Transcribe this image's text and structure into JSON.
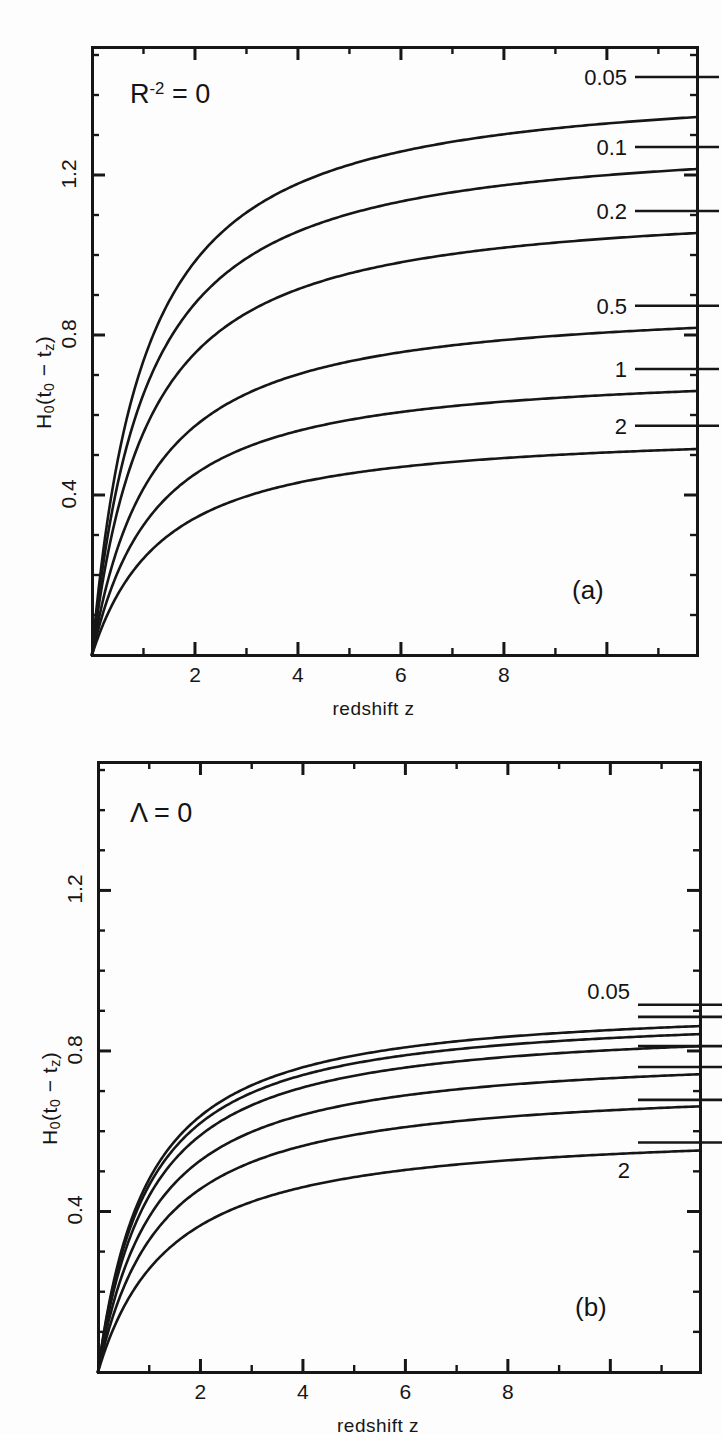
{
  "figure": {
    "background": "#fdfdfd",
    "ink_color": "#161616"
  },
  "panels": [
    {
      "id": "panel-a",
      "tag": "(a)",
      "note": "R",
      "note_sup": "-2",
      "note_tail": "= 0",
      "note_full": "R^-2 = 0",
      "frame": {
        "x": 92,
        "y": 47,
        "width": 605,
        "height": 608
      },
      "xaxis": {
        "label": "redshift  z",
        "min": 0,
        "max": 11.75,
        "ticks": [
          2,
          4,
          6,
          8
        ],
        "tick_labels": [
          "2",
          "4",
          "6",
          "8"
        ],
        "minor_step": 1
      },
      "yaxis": {
        "label": "H",
        "label_sub1": "0",
        "label_mid": "(t",
        "label_sub2": "0",
        "label_dash": " − t",
        "label_sub3": "z",
        "label_close": ")",
        "label_full": "H0(t0 - tz)",
        "min": 0,
        "max": 1.52,
        "ticks": [
          0.4,
          0.8,
          1.2
        ],
        "tick_labels": [
          "0.4",
          "0.8",
          "1.2"
        ],
        "minor_step": 0.1
      },
      "curves": [
        {
          "label": "0.05",
          "omega": 0.05,
          "asymptote": 1.345,
          "knee": 1.15,
          "label_y_value": 1.44,
          "tick_y_value": 1.445
        },
        {
          "label": "0.1",
          "omega": 0.1,
          "asymptote": 1.215,
          "knee": 1.2,
          "label_y_value": 1.265,
          "tick_y_value": 1.27
        },
        {
          "label": "0.2",
          "omega": 0.2,
          "asymptote": 1.055,
          "knee": 1.25,
          "label_y_value": 1.105,
          "tick_y_value": 1.11
        },
        {
          "label": "0.5",
          "omega": 0.5,
          "asymptote": 0.818,
          "knee": 1.35,
          "label_y_value": 0.868,
          "tick_y_value": 0.873
        },
        {
          "label": "1",
          "omega": 1.0,
          "asymptote": 0.66,
          "knee": 1.45,
          "label_y_value": 0.71,
          "tick_y_value": 0.715
        },
        {
          "label": "2",
          "omega": 2.0,
          "asymptote": 0.515,
          "knee": 1.6,
          "label_y_value": 0.568,
          "tick_y_value": 0.573
        }
      ]
    },
    {
      "id": "panel-b",
      "tag": "(b)",
      "note": "Λ = 0",
      "note_full": "Lambda = 0",
      "frame": {
        "x": 98,
        "y": 762,
        "width": 602,
        "height": 610
      },
      "xaxis": {
        "label": "redshift  z",
        "min": 0,
        "max": 11.75,
        "ticks": [
          2,
          4,
          6,
          8
        ],
        "tick_labels": [
          "2",
          "4",
          "6",
          "8"
        ],
        "minor_step": 1
      },
      "yaxis": {
        "label_full": "H0(t0 - tz)",
        "min": 0,
        "max": 1.52,
        "ticks": [
          0.4,
          0.8,
          1.2
        ],
        "tick_labels": [
          "0.4",
          "0.8",
          "1.2"
        ],
        "minor_step": 0.1
      },
      "curves": [
        {
          "label": "0.05",
          "omega": 0.05,
          "asymptote": 0.862,
          "knee": 1.1,
          "label_y_value": 0.945,
          "tick_y_value": 0.915
        },
        {
          "label": "",
          "omega": 0.1,
          "asymptote": 0.842,
          "knee": 1.12,
          "label_y_value": null,
          "tick_y_value": 0.885
        },
        {
          "label": "",
          "omega": 0.2,
          "asymptote": 0.812,
          "knee": 1.18,
          "label_y_value": null,
          "tick_y_value": 0.812
        },
        {
          "label": "",
          "omega": 0.5,
          "asymptote": 0.742,
          "knee": 1.28,
          "label_y_value": null,
          "tick_y_value": 0.76
        },
        {
          "label": "",
          "omega": 1.0,
          "asymptote": 0.662,
          "knee": 1.42,
          "label_y_value": null,
          "tick_y_value": 0.678
        },
        {
          "label": "2",
          "omega": 2.0,
          "asymptote": 0.552,
          "knee": 1.62,
          "label_y_value": 0.498,
          "tick_y_value": 0.572
        }
      ]
    }
  ],
  "chart_data": {
    "type": "line",
    "title": "",
    "xlabel": "redshift  z",
    "ylabel": "H0(t0 - tz)",
    "xlim": [
      0,
      11.75
    ],
    "ylim": [
      0,
      1.52
    ],
    "grid": false,
    "legend": "curve-end labels",
    "panels": [
      {
        "name": "(a)",
        "annotation": "R^-2 = 0",
        "x": [
          0,
          0.25,
          0.5,
          1,
          1.5,
          2,
          3,
          4,
          5,
          6,
          8,
          10,
          11.75
        ],
        "series": [
          {
            "name": "0.05",
            "values": [
              0,
              0.235,
              0.415,
              0.66,
              0.82,
              0.932,
              1.08,
              1.165,
              1.218,
              1.254,
              1.299,
              1.324,
              1.341
            ]
          },
          {
            "name": "0.1",
            "values": [
              0,
              0.228,
              0.4,
              0.628,
              0.772,
              0.87,
              0.995,
              1.064,
              1.107,
              1.136,
              1.172,
              1.193,
              1.208
            ]
          },
          {
            "name": "0.2",
            "values": [
              0,
              0.22,
              0.382,
              0.588,
              0.712,
              0.793,
              0.892,
              0.946,
              0.979,
              1.001,
              1.029,
              1.045,
              1.056
            ]
          },
          {
            "name": "0.5",
            "values": [
              0,
              0.204,
              0.346,
              0.514,
              0.608,
              0.666,
              0.733,
              0.768,
              0.789,
              0.803,
              0.82,
              0.83,
              0.837
            ]
          },
          {
            "name": "1",
            "values": [
              0,
              0.188,
              0.311,
              0.448,
              0.519,
              0.561,
              0.608,
              0.632,
              0.646,
              0.655,
              0.666,
              0.673,
              0.677
            ]
          },
          {
            "name": "2",
            "values": [
              0,
              0.168,
              0.272,
              0.38,
              0.432,
              0.462,
              0.494,
              0.51,
              0.519,
              0.525,
              0.532,
              0.536,
              0.539
            ]
          }
        ]
      },
      {
        "name": "(b)",
        "annotation": "Lambda = 0",
        "x": [
          0,
          0.25,
          0.5,
          1,
          1.5,
          2,
          3,
          4,
          5,
          6,
          8,
          10,
          11.75
        ],
        "series": [
          {
            "name": "0.05",
            "values": [
              0,
              0.215,
              0.372,
              0.58,
              0.695,
              0.763,
              0.83,
              0.857,
              0.869,
              0.876,
              0.884,
              0.888,
              0.89
            ]
          },
          {
            "name": "0.1",
            "values": [
              0,
              0.212,
              0.366,
              0.568,
              0.68,
              0.745,
              0.81,
              0.836,
              0.849,
              0.856,
              0.864,
              0.868,
              0.87
            ]
          },
          {
            "name": "0.2",
            "values": [
              0,
              0.207,
              0.356,
              0.549,
              0.654,
              0.715,
              0.777,
              0.803,
              0.816,
              0.823,
              0.832,
              0.836,
              0.839
            ]
          },
          {
            "name": "0.5",
            "values": [
              0,
              0.194,
              0.329,
              0.498,
              0.589,
              0.641,
              0.694,
              0.717,
              0.729,
              0.736,
              0.744,
              0.749,
              0.751
            ]
          },
          {
            "name": "1",
            "values": [
              0,
              0.18,
              0.3,
              0.442,
              0.517,
              0.559,
              0.603,
              0.622,
              0.633,
              0.639,
              0.646,
              0.65,
              0.652
            ]
          },
          {
            "name": "2",
            "values": [
              0,
              0.163,
              0.265,
              0.378,
              0.436,
              0.47,
              0.507,
              0.524,
              0.533,
              0.539,
              0.546,
              0.55,
              0.552
            ]
          }
        ]
      }
    ]
  }
}
